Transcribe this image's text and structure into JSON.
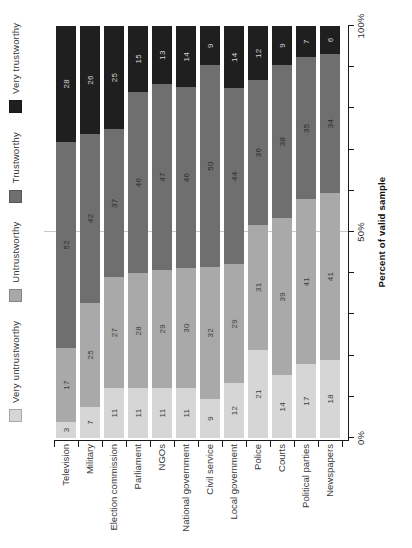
{
  "chart_data": {
    "type": "bar",
    "stacked": true,
    "orientation": "horizontal bars, whole chart rotated 90 degrees counterclockwise",
    "title": "",
    "xlabel": "Percent of valid sample",
    "categories": [
      "Television",
      "Military",
      "Election commission",
      "Parliament",
      "NGOs",
      "National government",
      "Civil service",
      "Local government",
      "Police",
      "Courts",
      "Political parties",
      "Newspapers"
    ],
    "series": [
      {
        "name": "Very untrustworthy",
        "color": "#d6d6d6",
        "label_color": "#3c3c3c",
        "values": [
          3,
          7,
          11,
          11,
          11,
          11,
          9,
          12,
          21,
          14,
          17,
          18
        ]
      },
      {
        "name": "Untrustworthy",
        "color": "#a9a9a9",
        "label_color": "#3c3c3c",
        "values": [
          17,
          25,
          27,
          28,
          29,
          30,
          32,
          29,
          31,
          39,
          41,
          41
        ]
      },
      {
        "name": "Trustworthy",
        "color": "#6f6f6f",
        "label_color": "#2c2c2c",
        "values": [
          52,
          42,
          37,
          46,
          47,
          46,
          50,
          44,
          36,
          38,
          35,
          34
        ]
      },
      {
        "name": "Very trustworthy",
        "color": "#1f1f1f",
        "label_color": "#d6d6d6",
        "values": [
          28,
          26,
          25,
          15,
          13,
          14,
          9,
          14,
          12,
          9,
          7,
          6
        ]
      }
    ],
    "percent_axis": {
      "min": 0,
      "max": 100,
      "tick_step": 10,
      "labeled_ticks": [
        {
          "pct": 0,
          "label": "0%"
        },
        {
          "pct": 50,
          "label": "50%"
        },
        {
          "pct": 100,
          "label": "100%"
        }
      ]
    },
    "gridlines": [
      50
    ],
    "legend_position": "top (left edge of rotated screenshot)",
    "legend_entries": [
      "Very untrustworthy",
      "Untrustworthy",
      "Trustworthy",
      "Very trustworthy"
    ]
  }
}
